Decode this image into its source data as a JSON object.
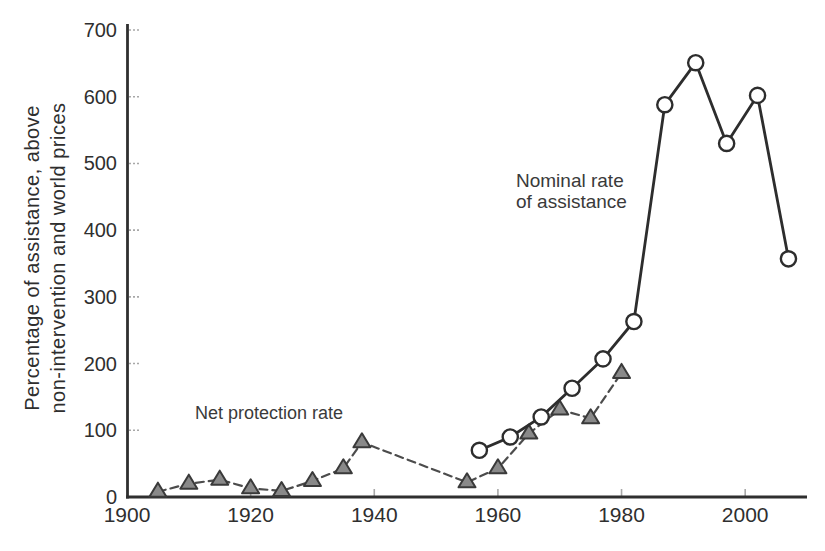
{
  "figure": {
    "background": "#ffffff"
  },
  "colors": {
    "axis": "#2f2f2f",
    "text": "#2f2f2f",
    "tick": "#a8a8a8",
    "nra_line": "#2d2d2d",
    "npr_line": "#4c4c4c",
    "circle_fill": "#ffffff",
    "circle_stroke": "#2d2d2d",
    "triangle_fill": "#898989",
    "triangle_stroke": "#3a3a3a"
  },
  "chart_data": {
    "type": "line",
    "title": "",
    "xlabel": "",
    "ylabel_line1": "Percentage of assistance, above",
    "ylabel_line2": "non-intervention and world prices",
    "xlim": [
      1900,
      2010
    ],
    "ylim": [
      0,
      700
    ],
    "x_ticks": [
      "1900",
      "1920",
      "1940",
      "1960",
      "1980",
      "2000"
    ],
    "x_tick_values": [
      1900,
      1920,
      1940,
      1960,
      1980,
      2000
    ],
    "y_ticks": [
      "0",
      "100",
      "200",
      "300",
      "400",
      "500",
      "600",
      "700"
    ],
    "y_tick_values": [
      0,
      100,
      200,
      300,
      400,
      500,
      600,
      700
    ],
    "grid": false,
    "legend_position": "inline-annotations",
    "series": [
      {
        "name": "Net protection rate",
        "marker": "triangle",
        "line_style": "dashed",
        "points": [
          [
            1905,
            8
          ],
          [
            1910,
            20
          ],
          [
            1915,
            26
          ],
          [
            1920,
            13
          ],
          [
            1925,
            9
          ],
          [
            1930,
            24
          ],
          [
            1935,
            43
          ],
          [
            1938,
            82
          ],
          [
            1955,
            22
          ],
          [
            1960,
            43
          ],
          [
            1965,
            95
          ],
          [
            1970,
            131
          ],
          [
            1975,
            118
          ],
          [
            1980,
            186
          ]
        ]
      },
      {
        "name": "Nominal rate of assistance",
        "marker": "circle",
        "line_style": "solid",
        "points": [
          [
            1957,
            70
          ],
          [
            1962,
            90
          ],
          [
            1967,
            120
          ],
          [
            1972,
            163
          ],
          [
            1977,
            207
          ],
          [
            1982,
            263
          ],
          [
            1987,
            588
          ],
          [
            1992,
            651
          ],
          [
            1997,
            530
          ],
          [
            2002,
            602
          ],
          [
            2007,
            357
          ]
        ]
      }
    ],
    "annotations": {
      "nominal": {
        "line1": "Nominal rate",
        "line2": "of assistance",
        "x": 1963,
        "y": 473
      },
      "net": {
        "text": "Net protection rate",
        "x": 1911,
        "y": 126
      }
    }
  }
}
